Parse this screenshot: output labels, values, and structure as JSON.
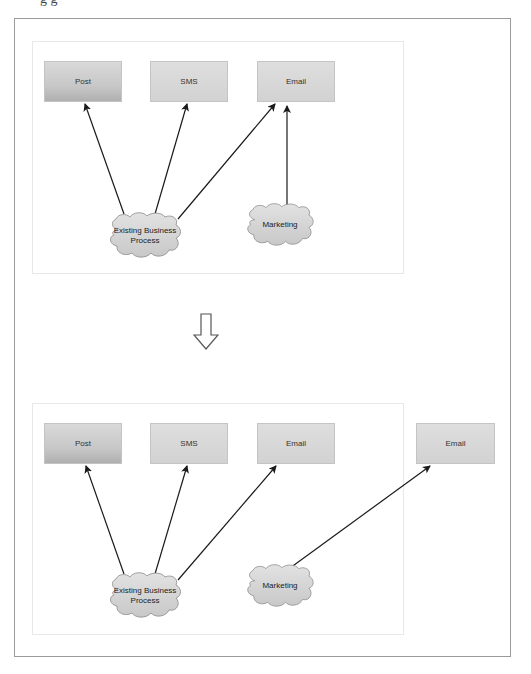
{
  "top_text_fragment": "g g",
  "transition_icon": "hollow-down-arrow-icon",
  "before_diagram": {
    "channels": [
      {
        "label": "Post"
      },
      {
        "label": "SMS"
      },
      {
        "label": "Email"
      }
    ],
    "sources": [
      {
        "label": "Existing Business Process",
        "line1": "Existing Business",
        "line2": "Process"
      },
      {
        "label": "Marketing"
      }
    ],
    "connections": [
      {
        "from": "Existing Business Process",
        "to": "Post"
      },
      {
        "from": "Existing Business Process",
        "to": "SMS"
      },
      {
        "from": "Existing Business Process",
        "to": "Email"
      },
      {
        "from": "Marketing",
        "to": "Email"
      }
    ]
  },
  "after_diagram": {
    "channels": [
      {
        "label": "Post"
      },
      {
        "label": "SMS"
      },
      {
        "label": "Email"
      }
    ],
    "external_channel": {
      "label": "Email"
    },
    "sources": [
      {
        "label": "Existing Business Process",
        "line1": "Existing Business",
        "line2": "Process"
      },
      {
        "label": "Marketing"
      }
    ],
    "connections": [
      {
        "from": "Existing Business Process",
        "to": "Post"
      },
      {
        "from": "Existing Business Process",
        "to": "SMS"
      },
      {
        "from": "Existing Business Process",
        "to": "Email"
      },
      {
        "from": "Marketing",
        "to": "Email (external)"
      }
    ]
  },
  "colors": {
    "frame_border": "#9a9a9a",
    "panel_border": "#e8e8e8",
    "box_fill": "#d2d2d2",
    "cloud_fill": "#d6d6d6",
    "arrow": "#1a1a1a"
  }
}
